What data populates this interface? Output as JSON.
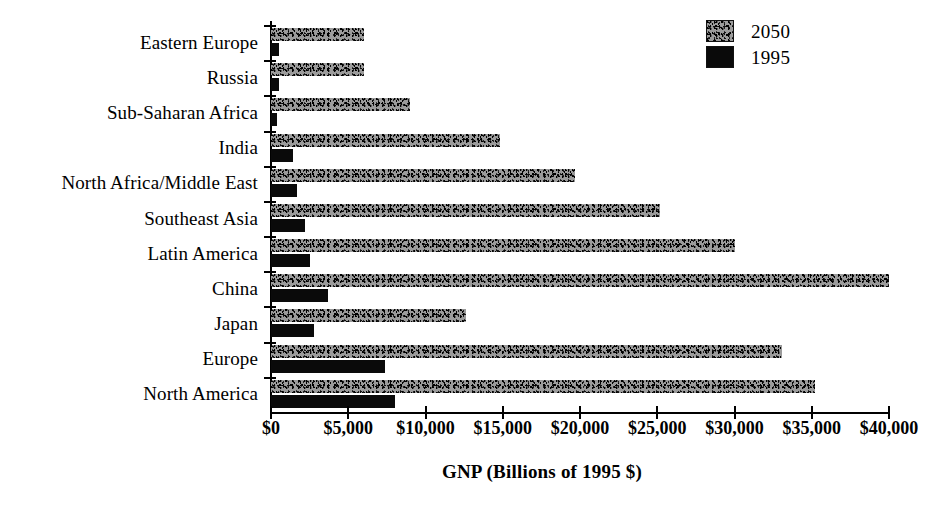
{
  "chart_data": {
    "type": "bar",
    "orientation": "horizontal",
    "title": "",
    "xlabel": "GNP (Billions of 1995 $)",
    "ylabel": "",
    "xlim": [
      0,
      40000
    ],
    "xticks": [
      0,
      5000,
      10000,
      15000,
      20000,
      25000,
      30000,
      35000,
      40000
    ],
    "xticklabels": [
      "$0",
      "$5,000",
      "$10,000",
      "$15,000",
      "$20,000",
      "$25,000",
      "$30,000",
      "$35,000",
      "$40,000"
    ],
    "grid": false,
    "legend_position": "top-right",
    "categories": [
      "Eastern Europe",
      "Russia",
      "Sub-Saharan Africa",
      "India",
      "North Africa/Middle East",
      "Southeast Asia",
      "Latin America",
      "China",
      "Japan",
      "Europe",
      "North America"
    ],
    "series": [
      {
        "name": "2050",
        "fill": "speckled-gray",
        "values": [
          6000,
          6000,
          9000,
          14800,
          19700,
          25200,
          30000,
          40000,
          12600,
          33100,
          35200
        ]
      },
      {
        "name": "1995",
        "fill": "solid-black",
        "values": [
          500,
          500,
          400,
          1400,
          1700,
          2200,
          2500,
          3700,
          2800,
          7400,
          8000
        ]
      }
    ]
  },
  "legend": {
    "items": [
      {
        "label": "2050",
        "swatch": "speckled-gray-swatch"
      },
      {
        "label": "1995",
        "swatch": "solid-black-swatch"
      }
    ]
  }
}
